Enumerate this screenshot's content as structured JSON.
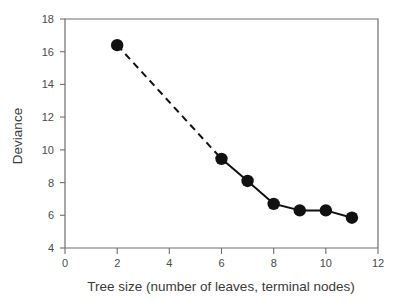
{
  "chart_data": {
    "type": "line",
    "title": "",
    "subtitle": "",
    "xlabel": "Tree size (number of leaves, terminal nodes)",
    "ylabel": "Deviance",
    "xlim": [
      0,
      12
    ],
    "ylim": [
      4,
      18
    ],
    "xticks": [
      0,
      2,
      4,
      6,
      8,
      10,
      12
    ],
    "yticks": [
      4,
      6,
      8,
      10,
      12,
      14,
      16,
      18
    ],
    "xtick_labels": [
      "0",
      "2",
      "4",
      "6",
      "8",
      "10",
      "12"
    ],
    "ytick_labels": [
      "4",
      "6",
      "8",
      "10",
      "12",
      "14",
      "16",
      "18"
    ],
    "grid": false,
    "legend": null,
    "legend_position": "none",
    "marker_style": "filled-circle",
    "marker_color": "#111111",
    "line_color": "#111111",
    "axis_color": "#6e6e6e",
    "background_color": "#ffffff",
    "series": [
      {
        "name": "deviance-vs-tree-size",
        "x": [
          2,
          6,
          7,
          8,
          9,
          10,
          11
        ],
        "values": [
          16.4,
          9.45,
          8.1,
          6.7,
          6.3,
          6.3,
          5.85
        ],
        "segment_styles": [
          "dashed",
          "solid",
          "solid",
          "solid",
          "solid",
          "solid"
        ]
      }
    ]
  },
  "axes": {
    "x_title": "Tree size (number of leaves, terminal nodes)",
    "y_title": "Deviance"
  }
}
